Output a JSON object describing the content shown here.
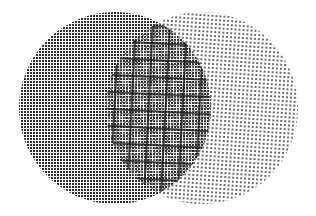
{
  "diagram": {
    "type": "venn",
    "set_count": 2,
    "background": "#ffffff",
    "sets": [
      {
        "id": "left",
        "shape": "circle",
        "cx": 115,
        "cy": 108,
        "r": 96,
        "fill_pattern": "dense-dots",
        "dot_pitch": 3,
        "dot_size": 2,
        "dot_color": "#2e2e2e"
      },
      {
        "id": "right",
        "shape": "circle",
        "cx": 202,
        "cy": 108,
        "r": 96,
        "fill_pattern": "sparse-dots",
        "dot_pitch": 4,
        "dot_size": 2,
        "dot_color": "#6e6e6e"
      }
    ],
    "intersection": {
      "fill_pattern": "moire-grid",
      "grid_pitch": 17,
      "grid_color": "#1a1a1a"
    },
    "labels": []
  }
}
